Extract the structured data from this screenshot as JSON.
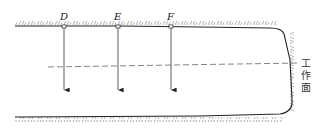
{
  "diagram": {
    "type": "tunnel-section-schematic",
    "points": [
      {
        "label": "D",
        "x": 64
      },
      {
        "label": "E",
        "x": 118
      },
      {
        "label": "F",
        "x": 171
      }
    ],
    "working_face_label": [
      "工",
      "作",
      "面"
    ],
    "colors": {
      "line": "#222222",
      "dashed": "#555555",
      "hatch": "#666666",
      "background": "#ffffff"
    }
  }
}
